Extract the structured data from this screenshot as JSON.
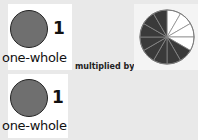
{
  "top": {
    "whole": {
      "number": "1",
      "label": "one-whole"
    },
    "operator": "multiplied by",
    "fraction_pie": {
      "total_slices": 12,
      "shaded_slices": 8,
      "shaded_color": "#3a3a3a",
      "unshaded_color": "#ffffff"
    }
  },
  "bottom": {
    "whole": {
      "number": "1",
      "label": "one-whole"
    }
  }
}
